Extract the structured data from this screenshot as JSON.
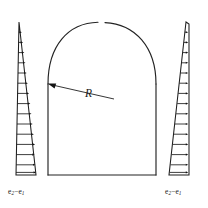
{
  "figure": {
    "domain_note": "engineering line diagram",
    "background_color": "#ffffff",
    "line_color": "#232323"
  },
  "arch": {
    "name": "tunnel-arch-outline",
    "description": "Horseshoe / arched tunnel cross-section: semicircular crown over vertical side walls closed by a flat invert",
    "crown_gap_at_top": true,
    "springline_y": 84,
    "left_wall_x": 48,
    "right_wall_x": 156,
    "invert_y": 175,
    "crown_top_y": 22
  },
  "radius": {
    "name": "radius-dimension",
    "label": "R",
    "arrow_tip": {
      "x": 48,
      "y": 84
    },
    "leader_end": {
      "x": 114,
      "y": 99
    },
    "label_position": {
      "x": 85,
      "y": 88
    }
  },
  "left_load": {
    "name": "left-lateral-pressure-wedge",
    "label_html": "e<sub>2</sub>&#8722;e<sub>1</sub>",
    "label_plain": "e2-e1",
    "arrow_direction": "right",
    "arrow_count": 15,
    "apex": {
      "x": 19,
      "y": 22
    },
    "base_left": {
      "x": 16,
      "y": 175
    },
    "base_right": {
      "x": 36,
      "y": 175
    },
    "vertical_edge_x": 16,
    "note": "Triangular pressure diagram increasing linearly with depth"
  },
  "right_load": {
    "name": "right-lateral-pressure-wedge",
    "label_html": "e<sub>2</sub>&#8722;e<sub>1</sub>",
    "label_plain": "e2-e1",
    "arrow_direction": "right",
    "arrow_count": 15,
    "apex": {
      "x": 186,
      "y": 22
    },
    "base_left": {
      "x": 169,
      "y": 175
    },
    "base_right": {
      "x": 189,
      "y": 175
    },
    "vertical_edge_x": 189,
    "note": "Triangular pressure diagram increasing linearly with depth"
  },
  "chart_data": {
    "type": "line",
    "xlabel": "pressure  e2-e1",
    "ylabel": "depth",
    "grid": false,
    "legend": "none",
    "series": [
      {
        "name": "left wedge pressure (e2-e1)",
        "x": [
          0.0,
          0.07,
          0.14,
          0.21,
          0.28,
          0.36,
          0.43,
          0.5,
          0.57,
          0.64,
          0.71,
          0.79,
          0.86,
          0.93,
          1.0
        ],
        "y": [
          0.0,
          0.071,
          0.143,
          0.214,
          0.286,
          0.357,
          0.429,
          0.5,
          0.571,
          0.643,
          0.714,
          0.786,
          0.857,
          0.929,
          1.0
        ]
      },
      {
        "name": "right wedge pressure (e2-e1)",
        "x": [
          0.0,
          0.07,
          0.14,
          0.21,
          0.28,
          0.36,
          0.43,
          0.5,
          0.57,
          0.64,
          0.71,
          0.79,
          0.86,
          0.93,
          1.0
        ],
        "y": [
          0.0,
          0.071,
          0.143,
          0.214,
          0.286,
          0.357,
          0.429,
          0.5,
          0.571,
          0.643,
          0.714,
          0.786,
          0.857,
          0.929,
          1.0
        ]
      }
    ],
    "xlim": [
      0,
      1
    ],
    "ylim": [
      0,
      1
    ]
  }
}
